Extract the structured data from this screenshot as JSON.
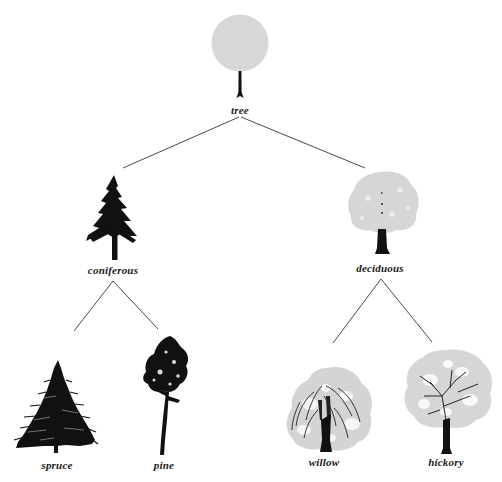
{
  "diagram": {
    "type": "taxonomy-tree",
    "root": {
      "label": "tree",
      "children": [
        {
          "label": "coniferous",
          "children": [
            {
              "label": "spruce"
            },
            {
              "label": "pine"
            }
          ]
        },
        {
          "label": "deciduous",
          "children": [
            {
              "label": "willow"
            },
            {
              "label": "hickory"
            }
          ]
        }
      ]
    },
    "nodes": {
      "tree": {
        "label": "tree",
        "x": 240,
        "y": 110
      },
      "coniferous": {
        "label": "coniferous",
        "x": 113,
        "y": 270
      },
      "deciduous": {
        "label": "deciduous",
        "x": 380,
        "y": 268
      },
      "spruce": {
        "label": "spruce",
        "x": 57,
        "y": 465
      },
      "pine": {
        "label": "pine",
        "x": 164,
        "y": 465
      },
      "willow": {
        "label": "willow",
        "x": 324,
        "y": 462
      },
      "hickory": {
        "label": "hickory",
        "x": 446,
        "y": 462
      }
    },
    "colors": {
      "line": "#4a4a4a",
      "foliage_gray": "#d6d6d6",
      "ink": "#111111",
      "label": "#1a1a1a"
    }
  }
}
